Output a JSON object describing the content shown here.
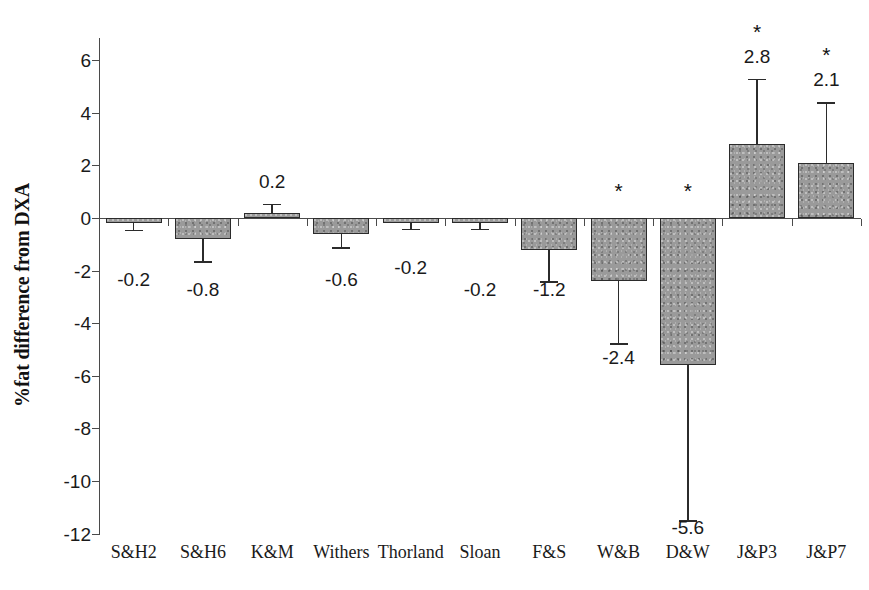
{
  "chart_data": {
    "type": "bar",
    "title": "",
    "xlabel": "",
    "ylabel": "%fat difference from DXA",
    "ylim": [
      -12,
      7
    ],
    "yticks": [
      6,
      4,
      2,
      0,
      -2,
      -4,
      -6,
      -8,
      -10,
      -12
    ],
    "ytick_labels": [
      "6",
      "4",
      "2",
      "0",
      "-2",
      "-4",
      "-6",
      "-8",
      "-10",
      "-12"
    ],
    "grid": false,
    "legend": "none",
    "error_bar_type": "standard deviation",
    "significance_marker": "*",
    "categories": [
      "S&H2",
      "S&H6",
      "K&M",
      "Withers",
      "Thorland",
      "Sloan",
      "F&S",
      "W&B",
      "D&W",
      "J&P3",
      "J&P7"
    ],
    "values": [
      -0.2,
      -0.8,
      0.2,
      -0.6,
      -0.2,
      -0.2,
      -1.2,
      -2.4,
      -5.6,
      2.8,
      2.1
    ],
    "value_labels": [
      "-0.2",
      "-0.8",
      "0.2",
      "-0.6",
      "-0.2",
      "-0.2",
      "-1.2",
      "-2.4",
      "-5.6",
      "2.8",
      "2.1"
    ],
    "errors": [
      0.25,
      0.85,
      0.35,
      0.5,
      0.2,
      0.2,
      1.2,
      2.35,
      5.9,
      2.5,
      2.3
    ],
    "significant": [
      false,
      false,
      false,
      false,
      false,
      false,
      false,
      true,
      true,
      true,
      true
    ]
  },
  "axes": {
    "y_title": "%fat difference from DXA"
  }
}
